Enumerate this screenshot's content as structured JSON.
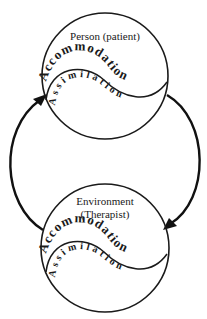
{
  "diagram": {
    "top_node": {
      "title": "Person (patient)",
      "outer_label": "Accommodation",
      "inner_label": "Assimilation"
    },
    "bottom_node": {
      "title_line1": "Environment",
      "title_line2": "(Therapist)",
      "outer_label": "Accommodation",
      "inner_label": "Assimilation"
    },
    "arrows": [
      {
        "from": "bottom_node",
        "to": "top_node",
        "side": "left"
      },
      {
        "from": "top_node",
        "to": "bottom_node",
        "side": "right"
      }
    ],
    "colors": {
      "stroke": "#1a1a1a",
      "background": "#ffffff"
    }
  }
}
